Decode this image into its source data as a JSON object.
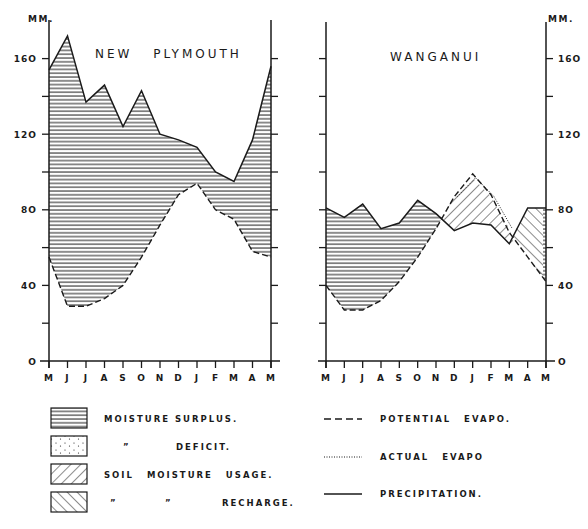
{
  "chart_data": [
    {
      "type": "line",
      "title": "NEW PLYMOUTH",
      "ylabel": "MM.",
      "xlabel": "",
      "categories": [
        "M",
        "J",
        "J",
        "A",
        "S",
        "O",
        "N",
        "D",
        "J",
        "F",
        "M",
        "A",
        "M"
      ],
      "yticks": [
        0,
        40,
        80,
        120,
        160
      ],
      "ylim": [
        0,
        180
      ],
      "series": [
        {
          "name": "PRECIPITATION.",
          "style": "solid",
          "values": [
            154,
            172,
            137,
            146,
            124,
            143,
            120,
            117,
            113,
            100,
            95,
            117,
            156
          ]
        },
        {
          "name": "POTENTIAL EVAPO.",
          "style": "dashed",
          "values": [
            55,
            29,
            29,
            33,
            40,
            55,
            72,
            88,
            94,
            80,
            75,
            58,
            55
          ]
        }
      ],
      "shaded_regions": [
        {
          "type": "MOISTURE SURPLUS.",
          "between": [
            "PRECIPITATION.",
            "POTENTIAL EVAPO."
          ],
          "months": "M-M (all year)"
        }
      ]
    },
    {
      "type": "line",
      "title": "WANGANUI",
      "ylabel": "MM.",
      "xlabel": "",
      "categories": [
        "M",
        "J",
        "J",
        "A",
        "S",
        "O",
        "N",
        "D",
        "J",
        "F",
        "M",
        "A",
        "M"
      ],
      "yticks": [
        0,
        40,
        80,
        120,
        160
      ],
      "ylim": [
        0,
        180
      ],
      "series": [
        {
          "name": "PRECIPITATION.",
          "style": "solid",
          "values": [
            81,
            76,
            83,
            70,
            73,
            85,
            78,
            69,
            73,
            72,
            62,
            81,
            81
          ]
        },
        {
          "name": "POTENTIAL EVAPO.",
          "style": "dashed",
          "values": [
            40,
            27,
            27,
            32,
            42,
            55,
            70,
            87,
            99,
            88,
            68,
            55,
            42
          ]
        },
        {
          "name": "ACTUAL EVAPO",
          "style": "dotted",
          "values": [
            null,
            null,
            null,
            null,
            null,
            null,
            null,
            87,
            97,
            87,
            70,
            null,
            null
          ]
        }
      ],
      "shaded_regions": [
        {
          "type": "MOISTURE SURPLUS.",
          "months": "M-N"
        },
        {
          "type": "SOIL MOISTURE USAGE.",
          "months": "N-M"
        },
        {
          "type": "RECHARGE.",
          "months": "M-M"
        }
      ]
    }
  ],
  "panels": {
    "left": {
      "title": "NEW PLYMOUTH",
      "unit": "MM."
    },
    "right": {
      "title": "WANGANUI",
      "unit": "MM."
    }
  },
  "axis": {
    "months": [
      "M",
      "J",
      "J",
      "A",
      "S",
      "O",
      "N",
      "D",
      "J",
      "F",
      "M",
      "A",
      "M"
    ],
    "yticks": [
      "0",
      "40",
      "80",
      "120",
      "160"
    ]
  },
  "legend": {
    "fills": [
      {
        "label": "MOISTURE SURPLUS.",
        "pattern": "horizontal"
      },
      {
        "ditto": "”",
        "label": "DEFICIT.",
        "pattern": "dotted"
      },
      {
        "label": "SOIL MOISTURE USAGE.",
        "pattern": "backslash"
      },
      {
        "ditto1": "”",
        "ditto2": "”",
        "label": "RECHARGE.",
        "pattern": "slash"
      }
    ],
    "lines": [
      {
        "label": "POTENTIAL EVAPO.",
        "style": "dashed"
      },
      {
        "label": "ACTUAL EVAPO",
        "style": "dotted"
      },
      {
        "label": "PRECIPITATION.",
        "style": "solid"
      }
    ]
  },
  "colors": {
    "ink": "#1a1a1a",
    "paper": "#ffffff"
  }
}
